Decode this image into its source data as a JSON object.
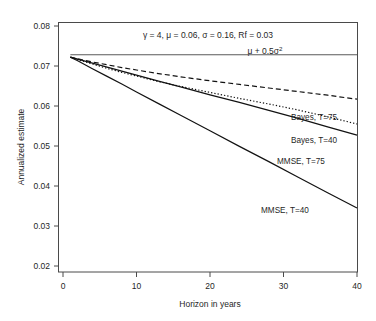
{
  "chart_data": {
    "type": "line",
    "title": "γ = 4, μ = 0.06, σ = 0.16, Rf = 0.03",
    "xlabel": "Horizon in years",
    "ylabel": "Annualized estimate",
    "xlim": [
      0,
      41
    ],
    "ylim": [
      0.018,
      0.0815
    ],
    "xticks": [
      0,
      10,
      20,
      30,
      40
    ],
    "xtick_labels": [
      "0",
      "10",
      "20",
      "30",
      "40"
    ],
    "yticks": [
      0.02,
      0.03,
      0.04,
      0.05,
      0.06,
      0.07,
      0.08
    ],
    "ytick_labels": [
      "0.02",
      "0.03",
      "0.04",
      "0.05",
      "0.06",
      "0.07",
      "0.08"
    ],
    "grid": false,
    "legend": "inline-labels-right",
    "annotations": [
      {
        "name": "reference-line-label",
        "text": "μ + 0.5σ",
        "superscript": "2",
        "x": 27.5,
        "y": 0.0745
      }
    ],
    "reference_line": {
      "name": "mu-plus-half-sigma-squared",
      "value": 0.0728,
      "x_start": 1,
      "x_end": 40,
      "style": "solid"
    },
    "series": [
      {
        "name": "Bayes, T=75",
        "style": "dashed",
        "label_x": 31.5,
        "label_y": 0.0636,
        "x": [
          1,
          2,
          4,
          6,
          8,
          10,
          13,
          16,
          20,
          24,
          28,
          32,
          36,
          40
        ],
        "values": [
          0.0722,
          0.0718,
          0.071,
          0.0703,
          0.0696,
          0.069,
          0.0681,
          0.0673,
          0.0663,
          0.0654,
          0.0645,
          0.0636,
          0.0627,
          0.0617
        ]
      },
      {
        "name": "Bayes, T=40",
        "style": "dotted",
        "label_x": 31.5,
        "label_y": 0.0578,
        "x": [
          1,
          2,
          4,
          6,
          8,
          10,
          13,
          16,
          20,
          24,
          28,
          32,
          36,
          40
        ],
        "values": [
          0.0722,
          0.0716,
          0.0705,
          0.0694,
          0.0684,
          0.0675,
          0.0661,
          0.0649,
          0.0634,
          0.0619,
          0.0605,
          0.059,
          0.0573,
          0.0555
        ]
      },
      {
        "name": "MMSE, T=75",
        "style": "solid",
        "label_x": 29.5,
        "label_y": 0.0525,
        "x": [
          1,
          2,
          4,
          6,
          8,
          10,
          13,
          16,
          20,
          24,
          28,
          32,
          36,
          40
        ],
        "values": [
          0.0722,
          0.0717,
          0.0707,
          0.0697,
          0.0687,
          0.0677,
          0.0662,
          0.0648,
          0.0628,
          0.0609,
          0.0589,
          0.0569,
          0.0548,
          0.0527
        ]
      },
      {
        "name": "MMSE, T=40",
        "style": "solid",
        "label_x": 27.5,
        "label_y": 0.0375,
        "x": [
          1,
          2,
          4,
          6,
          8,
          10,
          13,
          16,
          20,
          24,
          28,
          32,
          36,
          40
        ],
        "values": [
          0.0722,
          0.0713,
          0.0693,
          0.0674,
          0.0655,
          0.0635,
          0.0606,
          0.0577,
          0.0538,
          0.0499,
          0.0461,
          0.0422,
          0.0383,
          0.0345
        ]
      }
    ]
  },
  "labels": {
    "title": "γ = 4, μ = 0.06, σ = 0.16, Rf = 0.03",
    "xlabel": "Horizon in years",
    "ylabel": "Annualized estimate",
    "refline_base": "μ + 0.5σ",
    "refline_exponent": "2",
    "series_bayes_75": "Bayes, T=75",
    "series_bayes_40": "Bayes, T=40",
    "series_mmse_75": "MMSE, T=75",
    "series_mmse_40": "MMSE, T=40",
    "ytick_0": "0.08",
    "ytick_1": "0.07",
    "ytick_2": "0.06",
    "ytick_3": "0.05",
    "ytick_4": "0.04",
    "ytick_5": "0.03",
    "ytick_6": "0.02",
    "xtick_0": "0",
    "xtick_1": "10",
    "xtick_2": "20",
    "xtick_3": "30",
    "xtick_4": "40"
  },
  "colors": {
    "line": "#121212",
    "refline": "#5a5a5a",
    "axis": "#4a4a4a",
    "text": "#1f1f1f",
    "background": "#ffffff"
  }
}
